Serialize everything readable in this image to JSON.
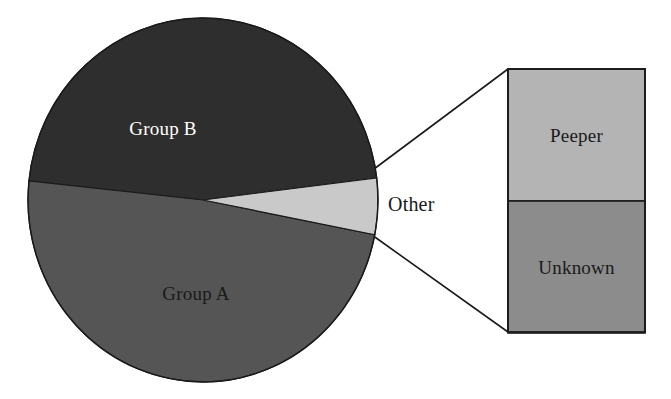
{
  "chart_data": {
    "type": "pie",
    "title": "",
    "subtitle": "",
    "xlabel": "",
    "ylabel": "",
    "legend": "none",
    "grid": false,
    "variant": "pie-of-pie with exploded stacked bar",
    "categories": [
      "Group B",
      "Group A",
      "Other"
    ],
    "values": [
      48,
      43,
      9
    ],
    "value_unit": "percent",
    "slices": [
      {
        "label": "Group B",
        "value": 48,
        "color": "#2e2e2e",
        "label_color": "#ffffff",
        "label_x": 163,
        "label_y": 135,
        "start_angle_deg": 186.0,
        "end_angle_deg": 353.0
      },
      {
        "label": "Group A",
        "value": 43,
        "color": "#555555",
        "label_color": "#1a1a1a",
        "label_x": 196,
        "label_y": 300,
        "start_angle_deg": 11.0,
        "end_angle_deg": 186.0
      },
      {
        "label": "Other",
        "value": 9,
        "color": "#c9c9c9",
        "label_color": "#1a1a1a",
        "label_x": 415,
        "label_y": 211,
        "label_position": "outside-right",
        "start_angle_deg": 353.0,
        "end_angle_deg": 11.0
      }
    ],
    "breakout": {
      "source_slice": "Other",
      "type": "stacked_bar",
      "categories": [
        "Peeper",
        "Unknown"
      ],
      "values": [
        50,
        50
      ],
      "segments": [
        {
          "label": "Peeper",
          "value": 50,
          "color": "#b4b4b4",
          "label_color": "#1a1a1a"
        },
        {
          "label": "Unknown",
          "value": 50,
          "color": "#8c8c8c",
          "label_color": "#1a1a1a"
        }
      ]
    },
    "colors": {
      "group_b": "#2e2e2e",
      "group_a": "#555555",
      "other": "#c9c9c9",
      "peeper": "#b4b4b4",
      "unknown": "#8c8c8c",
      "outline": "#1a1a1a",
      "background": "#ffffff"
    }
  },
  "pie": {
    "center_x": 203,
    "center_y": 200,
    "radius_x": 175,
    "radius_y": 182,
    "group_b_label": "Group B",
    "group_a_label": "Group A",
    "other_label": "Other"
  },
  "bar": {
    "left": 508,
    "top": 69,
    "right": 645,
    "bottom": 332,
    "divider_y": 201,
    "peeper_label": "Peeper",
    "unknown_label": "Unknown"
  },
  "leaders": {
    "upper_from_x": 370,
    "upper_from_y": 172,
    "upper_to_x": 508,
    "upper_to_y": 69,
    "lower_from_x": 372,
    "lower_from_y": 235,
    "lower_to_x": 508,
    "lower_to_y": 332
  }
}
